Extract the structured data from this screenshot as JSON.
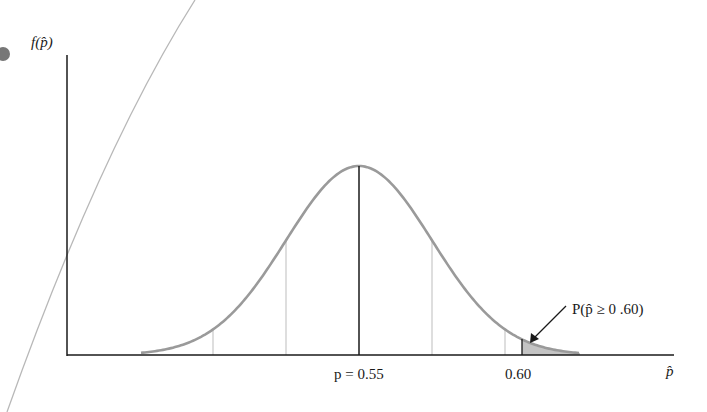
{
  "chart_data": {
    "type": "area",
    "title": "",
    "ylabel": "f(p̂)",
    "xlabel": "p̂",
    "mean_label": "p = 0.55",
    "mean": 0.55,
    "tick_labels": [
      "p = 0.55",
      "0.60"
    ],
    "ticks": [
      0.55,
      0.6
    ],
    "std_lines": [
      -2,
      -1,
      1,
      2
    ],
    "shaded_region": {
      "from": 0.6,
      "to": "right tail"
    },
    "annotation": "P(p̂ ≥ 0 .60)",
    "grid": false,
    "legend": null
  },
  "labels": {
    "y_axis": "f(p̂)",
    "x_axis": "p̂",
    "mean": "p = 0.55",
    "cutoff": "0.60",
    "tail_prob": "P(p̂ ≥ 0 .60)"
  },
  "colors": {
    "curve": "#9a9a9a",
    "axis": "#1a1a1a",
    "shade": "#c4c4c4",
    "std_line": "#bdbdbd"
  }
}
